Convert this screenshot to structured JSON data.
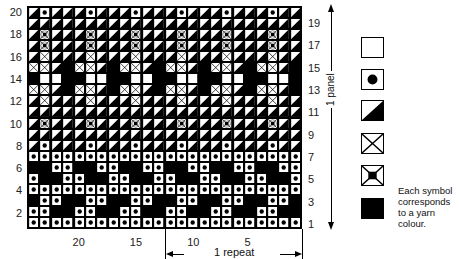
{
  "chart_data": {
    "type": "table",
    "columns": 24,
    "rows": 20,
    "symbol_codes": {
      "W": "white square",
      "D": "dot",
      "T": "half-diagonal (white/black)",
      "X": "cross",
      "F": "framed cross with black centre",
      "B": "black square"
    },
    "row_pattern_repeat_4": {
      "1": "DDDD",
      "2": "DDBB",
      "3": "BDDB",
      "4": "DDDD",
      "5": "DBBD",
      "6": "BBDD",
      "7": "DDDD",
      "8": "TDTT",
      "9": "TTTT",
      "10": "TFTT",
      "11": "TTTT",
      "12": "TXTT",
      "13": "XXTB",
      "14": "BWWB",
      "15": "XXTB",
      "16": "TXTT",
      "17": "TFTT",
      "18": "TFTT",
      "19": "TTTT",
      "20": "TDTT"
    },
    "row_labels_left": [
      "20",
      "18",
      "16",
      "14",
      "12",
      "10",
      "8",
      "6",
      "4",
      "2"
    ],
    "row_labels_right": [
      "19",
      "17",
      "15",
      "13",
      "11",
      "9",
      "7",
      "5",
      "3",
      "1"
    ],
    "col_labels": [
      "20",
      "15",
      "10",
      "5"
    ]
  },
  "labels": {
    "panel": "1 panel",
    "repeat": "1 repeat",
    "note": "Each symbol corresponds to a yarn colour."
  },
  "legend": [
    {
      "symbol": "white-square",
      "name": "legend-white"
    },
    {
      "symbol": "dot",
      "name": "legend-dot"
    },
    {
      "symbol": "diagonal",
      "name": "legend-diagonal"
    },
    {
      "symbol": "cross",
      "name": "legend-cross"
    },
    {
      "symbol": "framed-cross",
      "name": "legend-framed-cross"
    },
    {
      "symbol": "black-square",
      "name": "legend-black"
    }
  ]
}
